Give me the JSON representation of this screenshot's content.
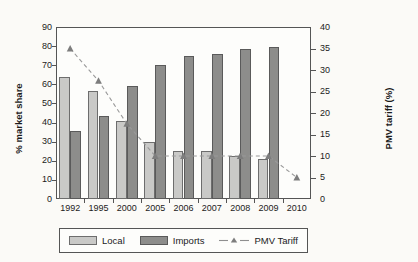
{
  "chart_data": {
    "type": "bar",
    "title": "",
    "subtitle": "",
    "xlabel": "",
    "ylabel": "% market share",
    "y2label": "PMV tariff (%)",
    "categories": [
      "1992",
      "1995",
      "2000",
      "2005",
      "2006",
      "2007",
      "2008",
      "2009",
      "2010"
    ],
    "ylim": [
      0,
      90
    ],
    "yticks": [
      0,
      10,
      20,
      30,
      40,
      50,
      60,
      70,
      80,
      90
    ],
    "y2lim": [
      0,
      40
    ],
    "y2ticks": [
      0,
      5,
      10,
      15,
      20,
      25,
      30,
      35,
      40
    ],
    "grid": false,
    "legend_position": "bottom",
    "series": [
      {
        "name": "Local",
        "type": "bar",
        "axis": "left",
        "color": "#c9c9c7",
        "values": [
          64,
          56.5,
          41,
          30,
          25,
          25,
          22.5,
          21,
          null
        ]
      },
      {
        "name": "Imports",
        "type": "bar",
        "axis": "left",
        "color": "#8d8d8b",
        "values": [
          35.5,
          43.5,
          59,
          70,
          75,
          76,
          78.5,
          79.5,
          null
        ]
      },
      {
        "name": "PMV Tariff",
        "type": "line",
        "axis": "right",
        "color": "#9a9a9a",
        "marker": "triangle",
        "dashed": true,
        "values": [
          35,
          27.5,
          17.5,
          10,
          10,
          10,
          10,
          10,
          5
        ]
      }
    ]
  },
  "axis": {
    "left_title": "% market share",
    "right_title": "PMV tariff (%)"
  },
  "legend": {
    "items": [
      {
        "label": "Local",
        "icon": "bar-swatch-light"
      },
      {
        "label": "Imports",
        "icon": "bar-swatch-dark"
      },
      {
        "label": "PMV Tariff",
        "icon": "dashed-line-triangle-marker"
      }
    ]
  }
}
